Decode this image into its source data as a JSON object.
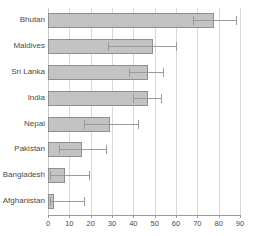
{
  "chart_data": {
    "type": "bar",
    "orientation": "horizontal",
    "title": "",
    "xlabel": "",
    "ylabel": "",
    "xlim": [
      0,
      90
    ],
    "xticks": [
      0,
      10,
      20,
      30,
      40,
      50,
      60,
      70,
      80,
      90
    ],
    "grid": true,
    "legend": "none",
    "error_bars": true,
    "categories": [
      "Bhutan",
      "Maldives",
      "Sri Lanka",
      "India",
      "Nepal",
      "Pakistan",
      "Bangladesh",
      "Afghanistan"
    ],
    "values": [
      78,
      49,
      47,
      47,
      29,
      16,
      8,
      3
    ],
    "error_low": [
      68,
      28,
      38,
      40,
      17,
      5,
      1,
      1
    ],
    "error_high": [
      88,
      60,
      54,
      53,
      42,
      27,
      19,
      17
    ],
    "series": [
      {
        "name": "value",
        "values": [
          78,
          49,
          47,
          47,
          29,
          16,
          8,
          3
        ]
      }
    ],
    "bar_color": "#c3c3c3",
    "bar_edge_color": "#8f8f8f",
    "grid_color": "#d9d9d9",
    "axis_color": "#9a9a9a",
    "points": [
      {
        "category": "Bhutan",
        "value": 78,
        "low": 68,
        "high": 88
      },
      {
        "category": "Maldives",
        "value": 49,
        "low": 28,
        "high": 60
      },
      {
        "category": "Sri Lanka",
        "value": 47,
        "low": 38,
        "high": 54
      },
      {
        "category": "India",
        "value": 47,
        "low": 40,
        "high": 53
      },
      {
        "category": "Nepal",
        "value": 29,
        "low": 17,
        "high": 42
      },
      {
        "category": "Pakistan",
        "value": 16,
        "low": 5,
        "high": 27
      },
      {
        "category": "Bangladesh",
        "value": 8,
        "low": 1,
        "high": 19
      },
      {
        "category": "Afghanistan",
        "value": 3,
        "low": 1,
        "high": 17
      }
    ]
  },
  "axis": {
    "tick_labels": [
      "0",
      "10",
      "20",
      "30",
      "40",
      "50",
      "60",
      "70",
      "80",
      "90"
    ]
  },
  "categories": {
    "labels": [
      "Bhutan",
      "Maldives",
      "Sri Lanka",
      "India",
      "Nepal",
      "Pakistan",
      "Bangladesh",
      "Afghanistan"
    ]
  }
}
